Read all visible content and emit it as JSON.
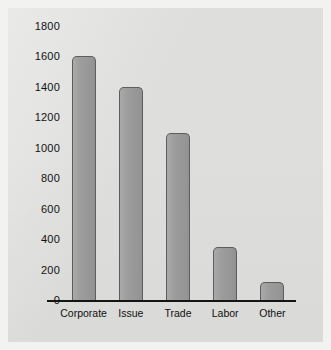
{
  "chart_data": {
    "type": "bar",
    "title": "",
    "subtitle": "",
    "xlabel": "",
    "ylabel": "",
    "categories": [
      "Corporate",
      "Issue",
      "Trade",
      "Labor",
      "Other"
    ],
    "values": [
      1600,
      1400,
      1100,
      350,
      120
    ],
    "ylim": [
      0,
      1800
    ],
    "ytick_step": 200,
    "yticks": [
      "0",
      "200",
      "400",
      "600",
      "800",
      "1000",
      "1200",
      "1400",
      "1600",
      "1800"
    ],
    "ytick_values": [
      0,
      200,
      400,
      600,
      800,
      1000,
      1200,
      1400,
      1600,
      1800
    ],
    "grid": false,
    "legend": false,
    "legend_position": "none",
    "annotations": [],
    "colors": {
      "bar_fill": "#9a9a9a",
      "bar_outline": "#5d5d5d",
      "panel_background": "#dededc",
      "outer_background": "#f2f2f1",
      "axis_line": "#141414",
      "tick_label": "#111111"
    }
  }
}
